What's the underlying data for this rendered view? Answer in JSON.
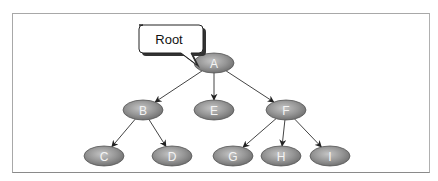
{
  "diagram": {
    "type": "tree",
    "callout": {
      "label": "Root",
      "points_to": "A"
    },
    "nodes": [
      {
        "id": "A",
        "label": "A",
        "x": 214,
        "y": 63
      },
      {
        "id": "B",
        "label": "B",
        "x": 143,
        "y": 110
      },
      {
        "id": "E",
        "label": "E",
        "x": 214,
        "y": 110
      },
      {
        "id": "F",
        "label": "F",
        "x": 286,
        "y": 110
      },
      {
        "id": "C",
        "label": "C",
        "x": 104,
        "y": 156
      },
      {
        "id": "D",
        "label": "D",
        "x": 172,
        "y": 156
      },
      {
        "id": "G",
        "label": "G",
        "x": 233,
        "y": 156
      },
      {
        "id": "H",
        "label": "H",
        "x": 281,
        "y": 156
      },
      {
        "id": "I",
        "label": "I",
        "x": 330,
        "y": 156
      }
    ],
    "edges": [
      {
        "from": "A",
        "to": "B"
      },
      {
        "from": "A",
        "to": "E"
      },
      {
        "from": "A",
        "to": "F"
      },
      {
        "from": "B",
        "to": "C"
      },
      {
        "from": "B",
        "to": "D"
      },
      {
        "from": "F",
        "to": "G"
      },
      {
        "from": "F",
        "to": "H"
      },
      {
        "from": "F",
        "to": "I"
      }
    ],
    "colors": {
      "node_fill": "#8c8c8c",
      "node_highlight": "#c8c8c8",
      "edge": "#444444",
      "frame": "#a8a8a8"
    }
  }
}
